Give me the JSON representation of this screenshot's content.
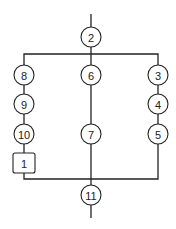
{
  "diagram": {
    "type": "flow-graph",
    "nodes": [
      {
        "id": "2",
        "label": "2",
        "shape": "circle",
        "cx": 91,
        "cy": 37
      },
      {
        "id": "8",
        "label": "8",
        "shape": "circle",
        "cx": 24,
        "cy": 75
      },
      {
        "id": "9",
        "label": "9",
        "shape": "circle",
        "cx": 24,
        "cy": 104
      },
      {
        "id": "10",
        "label": "10",
        "shape": "circle",
        "cx": 24,
        "cy": 134
      },
      {
        "id": "1",
        "label": "1",
        "shape": "box",
        "cx": 24,
        "cy": 163
      },
      {
        "id": "6",
        "label": "6",
        "shape": "circle",
        "cx": 91,
        "cy": 75
      },
      {
        "id": "7",
        "label": "7",
        "shape": "circle",
        "cx": 91,
        "cy": 134
      },
      {
        "id": "3",
        "label": "3",
        "shape": "circle",
        "cx": 158,
        "cy": 75
      },
      {
        "id": "4",
        "label": "4",
        "shape": "circle",
        "cx": 158,
        "cy": 104
      },
      {
        "id": "5",
        "label": "5",
        "shape": "circle",
        "cx": 158,
        "cy": 134
      },
      {
        "id": "11",
        "label": "11",
        "shape": "circle",
        "cx": 91,
        "cy": 195
      }
    ],
    "branches": [
      {
        "name": "left",
        "sequence": [
          "8",
          "9",
          "10",
          "1"
        ]
      },
      {
        "name": "center",
        "sequence": [
          "6",
          "7"
        ]
      },
      {
        "name": "right",
        "sequence": [
          "3",
          "4",
          "5"
        ]
      }
    ],
    "split_node": "2",
    "merge_node": "11"
  }
}
